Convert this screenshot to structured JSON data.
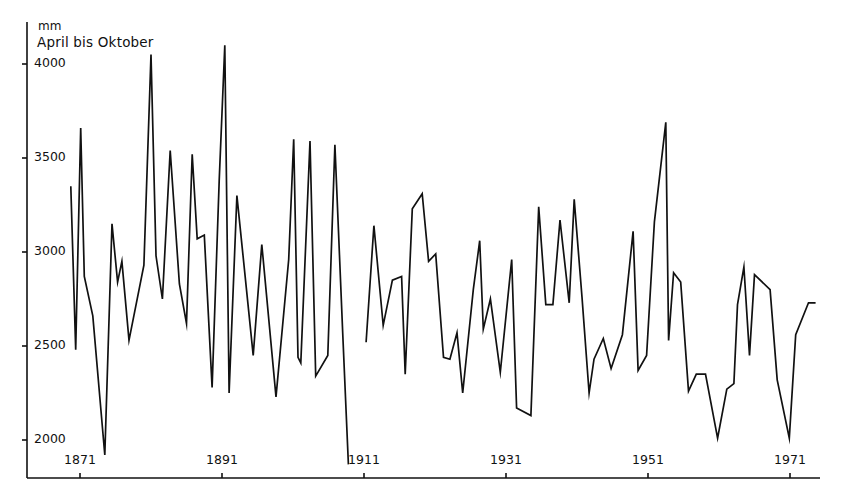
{
  "chart_data": {
    "type": "line",
    "title": "",
    "subtitle": "April bis Oktober",
    "ylabel": "mm",
    "xlabel": "",
    "ylim": [
      1850,
      4150
    ],
    "xlim": [
      1868,
      1975
    ],
    "grid": false,
    "legend": null,
    "y_ticks": [
      4000,
      3500,
      3000,
      2500,
      2000
    ],
    "y_tick_labels": [
      "4000",
      "3500",
      "3000",
      "2500",
      "2000"
    ],
    "x_ticks": [
      1871,
      1891,
      1911,
      1931,
      1951,
      1971
    ],
    "x_tick_labels": [
      "1871",
      "1891",
      "1911",
      "1931",
      "1951",
      "1971"
    ],
    "series": [
      {
        "name": "Niederschlag April bis Oktober (Segment 1)",
        "x": [
          1869.7,
          1870.4,
          1871.1,
          1871.6,
          1872.8,
          1874.5,
          1875.5,
          1876.3,
          1876.9,
          1877.9,
          1880.0,
          1881.0,
          1881.7,
          1882.6,
          1883.7,
          1885.0,
          1886.0,
          1886.8,
          1887.5,
          1888.5,
          1889.6,
          1890.6,
          1891.4,
          1892.0,
          1893.1,
          1895.4,
          1896.6,
          1898.6,
          1900.4,
          1901.1,
          1901.7,
          1902.1,
          1903.4,
          1904.2,
          1905.9,
          1906.9,
          1908.0,
          1908.8
        ],
        "values": [
          3350,
          2480,
          3660,
          2870,
          2660,
          1920,
          3150,
          2840,
          2950,
          2530,
          2930,
          4050,
          2980,
          2750,
          3540,
          2830,
          2620,
          3520,
          3070,
          3090,
          2280,
          3380,
          4100,
          2250,
          3300,
          2450,
          3040,
          2230,
          2960,
          3600,
          2440,
          2410,
          3590,
          2340,
          2450,
          3570,
          2570,
          1870
        ]
      },
      {
        "name": "Niederschlag April bis Oktober (Segment 2)",
        "x": [
          1911.3,
          1912.4,
          1913.7,
          1915.0,
          1916.3,
          1916.8,
          1917.8,
          1919.2,
          1920.1,
          1921.1,
          1922.2,
          1923.1,
          1924.1,
          1924.9,
          1926.4,
          1927.3,
          1927.8,
          1928.8,
          1930.2,
          1931.8,
          1932.5,
          1934.5,
          1935.6,
          1936.6,
          1937.6,
          1938.6,
          1939.9,
          1940.6,
          1941.7,
          1942.7,
          1943.4,
          1944.7,
          1945.8,
          1947.4,
          1948.9,
          1949.6,
          1950.8,
          1951.9,
          1953.5,
          1953.9,
          1954.6,
          1955.6,
          1956.7,
          1957.8,
          1959.1,
          1960.8,
          1962.1,
          1963.1,
          1963.6,
          1964.5,
          1965.3,
          1966.0,
          1968.2,
          1969.2,
          1970.9,
          1971.8,
          1973.6,
          1974.6
        ],
        "values": [
          2520,
          3140,
          2610,
          2850,
          2870,
          2350,
          3230,
          3310,
          2950,
          2990,
          2440,
          2430,
          2570,
          2250,
          2800,
          3060,
          2590,
          2750,
          2360,
          2960,
          2170,
          2130,
          3240,
          2720,
          2720,
          3170,
          2730,
          3280,
          2760,
          2250,
          2430,
          2540,
          2380,
          2560,
          3110,
          2370,
          2450,
          3160,
          3690,
          2530,
          2890,
          2840,
          2260,
          2350,
          2350,
          2010,
          2270,
          2300,
          2720,
          2920,
          2450,
          2880,
          2800,
          2320,
          2010,
          2560,
          2730,
          2730
        ]
      }
    ],
    "pixel_mapping": {
      "y_axis_x": 27,
      "x_axis_y": 478,
      "y_for_2000": 440,
      "y_for_4000": 64,
      "x_for_1871": 80,
      "x_for_1971": 790
    },
    "annotations": []
  },
  "labels": {
    "unit": "mm",
    "subtitle": "April bis Oktober"
  }
}
